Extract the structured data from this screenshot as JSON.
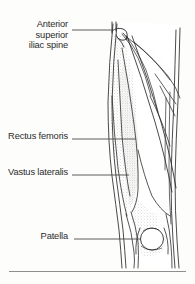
{
  "figure": {
    "kind": "anatomical-line-drawing",
    "view": "anterior view of right thigh",
    "ink_color": "#2b2b2b",
    "paper_color": "#fdfdfc",
    "shading_color": "#9a9a94",
    "rule_color": "#8e8e8e"
  },
  "labels": {
    "asis": "Anterior superior\niliac spine",
    "rectus_femoris": "Rectus femoris",
    "vastus_lateralis": "Vastus lateralis",
    "patella": "Patella"
  },
  "leaders": {
    "asis": {
      "x1": 72,
      "y1": 30,
      "x2": 113,
      "y2": 30
    },
    "rectus_femoris": {
      "x1": 72,
      "y1": 139,
      "x2": 136,
      "y2": 139
    },
    "vastus_lateralis": {
      "x1": 72,
      "y1": 175,
      "x2": 129,
      "y2": 175
    },
    "patella": {
      "x1": 74,
      "y1": 239,
      "x2": 141,
      "y2": 239
    }
  },
  "structures": [
    {
      "name": "anterior-superior-iliac-spine",
      "region": "top of thigh, hooked bony prominence"
    },
    {
      "name": "rectus-femoris",
      "region": "central shaded fusiform muscle belly"
    },
    {
      "name": "vastus-lateralis",
      "region": "lateral muscle mass along outer thigh"
    },
    {
      "name": "sartorius",
      "region": "long oblique band crossing thigh"
    },
    {
      "name": "patella",
      "region": "oval kneecap at distal thigh"
    },
    {
      "name": "knee-contour",
      "region": "bottom of limb below patella"
    }
  ],
  "rule": {
    "present": true
  }
}
